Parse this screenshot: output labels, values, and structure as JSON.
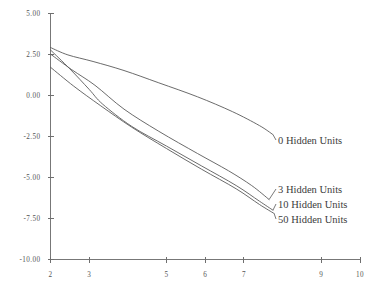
{
  "chart_data": {
    "type": "line",
    "title": "",
    "xlabel": "",
    "ylabel": "",
    "xlim": [
      2,
      10
    ],
    "ylim": [
      -10.0,
      5.0
    ],
    "grid": false,
    "legend_position": "right-inline",
    "x_ticks": [
      2,
      3,
      5,
      6,
      7,
      9,
      10
    ],
    "x_tick_labels": [
      "2",
      "3",
      "5",
      "6",
      "7",
      "9",
      "10"
    ],
    "y_ticks": [
      5.0,
      2.5,
      0.0,
      -2.5,
      -5.0,
      -7.5,
      -10.0
    ],
    "y_tick_labels": [
      "5.00",
      "2.50",
      "0.00",
      "-2.50",
      "-5.00",
      "-7.50",
      "-10.00"
    ],
    "series": [
      {
        "name": "0 Hidden Units",
        "label": "0 Hidden Units",
        "x": [
          2.0,
          2.45,
          3.1,
          3.9,
          4.8,
          5.8,
          6.7,
          7.4,
          7.75
        ],
        "values": [
          2.9,
          2.45,
          2.05,
          1.5,
          0.75,
          -0.1,
          -1.0,
          -1.85,
          -2.4
        ]
      },
      {
        "name": "3 Hidden Units",
        "label": "3 Hidden Units",
        "x": [
          2.0,
          2.55,
          3.15,
          3.9,
          4.8,
          5.8,
          6.6,
          7.2,
          7.65
        ],
        "values": [
          2.5,
          1.55,
          0.6,
          -0.85,
          -2.2,
          -3.55,
          -4.6,
          -5.5,
          -6.35
        ]
      },
      {
        "name": "10 Hidden Units",
        "label": "10 Hidden Units",
        "x": [
          2.0,
          2.5,
          3.0,
          3.35,
          4.1,
          5.0,
          5.9,
          6.8,
          7.4,
          7.75
        ],
        "values": [
          2.75,
          1.6,
          0.35,
          -0.55,
          -1.9,
          -3.1,
          -4.3,
          -5.5,
          -6.45,
          -7.0
        ]
      },
      {
        "name": "50 Hidden Units",
        "label": "50 Hidden Units",
        "x": [
          2.0,
          2.6,
          3.3,
          4.1,
          5.0,
          5.9,
          6.8,
          7.4,
          7.78
        ],
        "values": [
          1.7,
          0.55,
          -0.65,
          -1.95,
          -3.25,
          -4.5,
          -5.7,
          -6.65,
          -7.2
        ]
      }
    ],
    "colors": {
      "line": "#5a5a5a",
      "axis": "#777777",
      "text": "#3c3c3c",
      "background": "#ffffff"
    }
  },
  "legend_labels": {
    "s0": "0 Hidden Units",
    "s3": "3 Hidden Units",
    "s10": "10 Hidden Units",
    "s50": "50 Hidden Units"
  }
}
